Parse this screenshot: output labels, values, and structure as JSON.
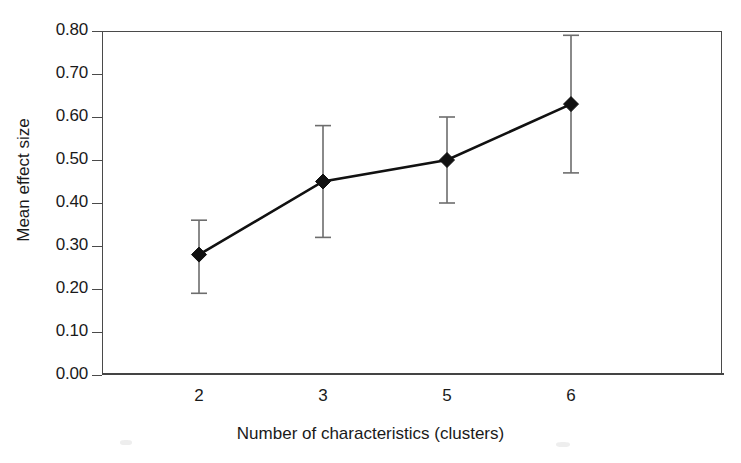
{
  "chart_data": {
    "type": "line",
    "title": "",
    "subtitle": "",
    "xlabel": "Number of characteristics (clusters)",
    "ylabel": "Mean effect size",
    "categories": [
      "2",
      "3",
      "5",
      "6"
    ],
    "values": [
      0.28,
      0.45,
      0.5,
      0.63
    ],
    "error_low": [
      0.19,
      0.32,
      0.4,
      0.47
    ],
    "error_high": [
      0.36,
      0.58,
      0.6,
      0.79
    ],
    "series": [
      {
        "name": "Mean effect size",
        "values": [
          0.28,
          0.45,
          0.5,
          0.63
        ],
        "error_low": [
          0.19,
          0.32,
          0.4,
          0.47
        ],
        "error_high": [
          0.36,
          0.58,
          0.6,
          0.79
        ],
        "marker": "filled-diamond",
        "color": "#111111"
      }
    ],
    "ylim": [
      0.0,
      0.8
    ],
    "yticks": [
      0.0,
      0.1,
      0.2,
      0.3,
      0.4,
      0.5,
      0.6,
      0.7,
      0.8
    ],
    "ytick_labels": [
      "0.00",
      "0.10",
      "0.20",
      "0.30",
      "0.40",
      "0.50",
      "0.60",
      "0.70",
      "0.80"
    ],
    "xtick_labels": [
      "2",
      "3",
      "5",
      "6"
    ],
    "grid": false,
    "legend": false,
    "legend_position": "none",
    "annotations": [],
    "colors": {
      "line": "#111111",
      "marker": "#111111",
      "errorbar": "#6d6d6d",
      "axis": "#4a4a4a",
      "text": "#1a1a1a",
      "background": "#ffffff"
    }
  }
}
